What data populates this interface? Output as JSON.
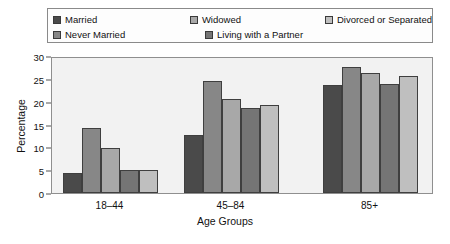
{
  "chart_data": {
    "type": "bar",
    "title": "",
    "xlabel": "Age Groups",
    "ylabel": "Percentage",
    "categories": [
      "18–44",
      "45–84",
      "85+"
    ],
    "ylim": [
      0,
      30
    ],
    "yticks": [
      0,
      5,
      10,
      15,
      20,
      25,
      30
    ],
    "grid": false,
    "legend_position": "top",
    "series": [
      {
        "name": "Married",
        "color": "#4a4a4a",
        "values": [
          4.3,
          12.7,
          23.7
        ]
      },
      {
        "name": "Never Married",
        "color": "#878787",
        "values": [
          14.2,
          24.6,
          27.7
        ]
      },
      {
        "name": "Widowed",
        "color": "#a8a8a8",
        "values": [
          9.8,
          20.6,
          26.2
        ]
      },
      {
        "name": "Living with a Partner",
        "color": "#757575",
        "values": [
          5.0,
          18.7,
          23.9
        ]
      },
      {
        "name": "Divorced or Separated",
        "color": "#bfbfbf",
        "values": [
          5.1,
          19.3,
          25.6
        ]
      }
    ]
  },
  "legend": {
    "items": [
      {
        "label": "Married",
        "color": "#4a4a4a"
      },
      {
        "label": "Widowed",
        "color": "#a8a8a8"
      },
      {
        "label": "Divorced or Separated",
        "color": "#bfbfbf"
      },
      {
        "label": "Never Married",
        "color": "#878787"
      },
      {
        "label": "Living with a Partner",
        "color": "#757575"
      }
    ]
  },
  "axes": {
    "y_title": "Percentage",
    "x_title": "Age Groups",
    "y_tick_labels": [
      "0",
      "5",
      "10",
      "15",
      "20",
      "25",
      "30"
    ],
    "x_tick_labels": [
      "18–44",
      "45–84",
      "85+"
    ]
  }
}
